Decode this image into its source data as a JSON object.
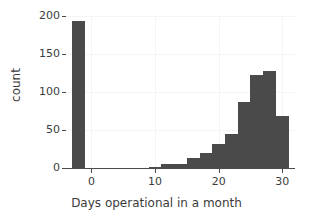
{
  "chart_data": {
    "type": "bar",
    "title": "",
    "subtitle": "",
    "xlabel": "Days operational in a month",
    "ylabel": "count",
    "xlim": [
      -4,
      32
    ],
    "ylim": [
      0,
      200
    ],
    "xticks": [
      0,
      10,
      20,
      30
    ],
    "xticklabels": [
      "0",
      "10",
      "20",
      "30"
    ],
    "yticks": [
      0,
      50,
      100,
      150,
      200
    ],
    "yticklabels": [
      "0",
      "50",
      "100",
      "150",
      "200"
    ],
    "grid": true,
    "legend": false,
    "bar_color": "#4a4a4a",
    "background_color": "#ffffff",
    "gridline_color": "#f2f4f6",
    "axis_color": "#4a4a4a",
    "bin_width": 2,
    "bins": [
      {
        "x_start": -3,
        "x_end": -1,
        "center": -2,
        "value": 193
      },
      {
        "x_start": -1,
        "x_end": 1,
        "center": 0,
        "value": 0
      },
      {
        "x_start": 1,
        "x_end": 3,
        "center": 2,
        "value": 0
      },
      {
        "x_start": 3,
        "x_end": 5,
        "center": 4,
        "value": 0
      },
      {
        "x_start": 5,
        "x_end": 7,
        "center": 6,
        "value": 0
      },
      {
        "x_start": 7,
        "x_end": 9,
        "center": 8,
        "value": 0
      },
      {
        "x_start": 9,
        "x_end": 11,
        "center": 10,
        "value": 1
      },
      {
        "x_start": 11,
        "x_end": 13,
        "center": 12,
        "value": 5
      },
      {
        "x_start": 13,
        "x_end": 15,
        "center": 14,
        "value": 5
      },
      {
        "x_start": 15,
        "x_end": 17,
        "center": 16,
        "value": 13
      },
      {
        "x_start": 17,
        "x_end": 19,
        "center": 18,
        "value": 20
      },
      {
        "x_start": 19,
        "x_end": 21,
        "center": 20,
        "value": 31
      },
      {
        "x_start": 21,
        "x_end": 23,
        "center": 22,
        "value": 45
      },
      {
        "x_start": 23,
        "x_end": 25,
        "center": 24,
        "value": 87
      },
      {
        "x_start": 25,
        "x_end": 27,
        "center": 26,
        "value": 123
      },
      {
        "x_start": 27,
        "x_end": 29,
        "center": 28,
        "value": 128
      },
      {
        "x_start": 29,
        "x_end": 31,
        "center": 30,
        "value": 69
      }
    ],
    "categories": [
      -2,
      0,
      2,
      4,
      6,
      8,
      10,
      12,
      14,
      16,
      18,
      20,
      22,
      24,
      26,
      28,
      30
    ],
    "values": [
      193,
      0,
      0,
      0,
      0,
      0,
      1,
      5,
      5,
      13,
      20,
      31,
      45,
      87,
      123,
      128,
      69
    ]
  }
}
